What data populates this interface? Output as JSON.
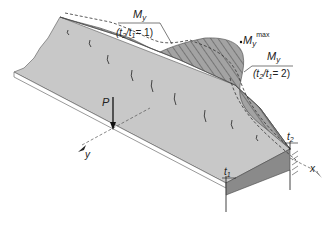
{
  "diagram": {
    "labels": {
      "moment_symbol": "M",
      "moment_sub": "y",
      "case1_ratio": "(t2/t1= 1)",
      "case1_t2": "t",
      "case1_t2_sub": "2",
      "case1_t1": "t",
      "case1_t1_sub": "1",
      "case1_eq": "= 1)",
      "case2_eq": "= 2)",
      "max_sup": "max",
      "load": "P",
      "axis_x": "x",
      "axis_y": "y",
      "thickness_1": "t",
      "thickness_1_sub": "1",
      "thickness_2": "t",
      "thickness_2_sub": "2"
    },
    "colors": {
      "plate_top": "#c8c8c8",
      "plate_edge": "#ffffff",
      "plate_side_dark": "#808080",
      "moment_fill": "#9a9a9a",
      "hatch": "#555555",
      "line": "#222222"
    }
  }
}
